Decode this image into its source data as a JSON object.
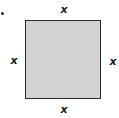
{
  "diagram": {
    "shape": "square",
    "fill_color": "#d2d2d2",
    "border_color": "#2a2a2a",
    "labels": {
      "top": "x",
      "left": "x",
      "right": "x",
      "bottom": "x"
    }
  }
}
